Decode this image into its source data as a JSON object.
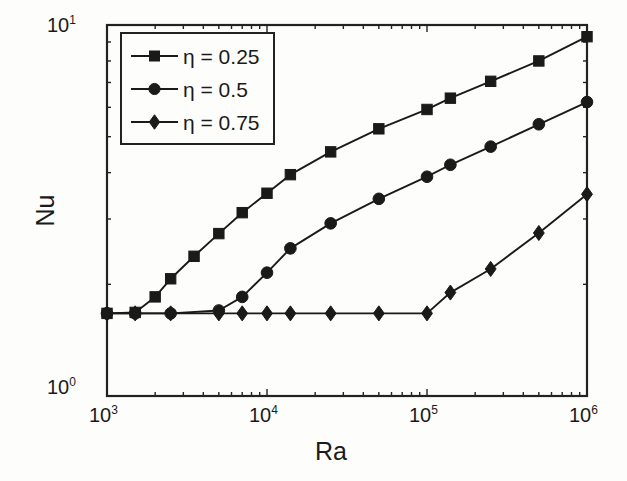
{
  "chart_data": {
    "type": "line",
    "title": "",
    "xlabel": "Ra",
    "ylabel": "Nu",
    "xscale": "log",
    "yscale": "log",
    "xlim": [
      1000,
      1000000
    ],
    "ylim": [
      1,
      10
    ],
    "grid": false,
    "legend_position": "top-left",
    "x_tick_labels": [
      "10",
      "10",
      "10",
      "10"
    ],
    "x_tick_exponents": [
      "3",
      "4",
      "5",
      "6"
    ],
    "x_tick_values": [
      1000,
      10000,
      100000,
      1000000
    ],
    "y_tick_labels": [
      "10",
      "10"
    ],
    "y_tick_exponents": [
      "0",
      "1"
    ],
    "y_tick_values": [
      1,
      10
    ],
    "series": [
      {
        "name": "η = 0.25",
        "marker": "square",
        "color": "#1a1a1a",
        "x": [
          1000,
          1500,
          2000,
          2500,
          3500,
          5000,
          7000,
          10000,
          14000,
          25000,
          50000,
          100000,
          140000,
          250000,
          500000,
          1000000
        ],
        "y": [
          1.67,
          1.68,
          1.85,
          2.07,
          2.38,
          2.74,
          3.12,
          3.52,
          3.95,
          4.55,
          5.25,
          5.92,
          6.35,
          7.05,
          8.0,
          9.3
        ]
      },
      {
        "name": "η = 0.5",
        "marker": "circle",
        "color": "#1a1a1a",
        "x": [
          1000,
          1500,
          2500,
          5000,
          7000,
          10000,
          14000,
          25000,
          50000,
          100000,
          140000,
          250000,
          500000,
          1000000
        ],
        "y": [
          1.67,
          1.67,
          1.67,
          1.7,
          1.85,
          2.15,
          2.5,
          2.92,
          3.4,
          3.9,
          4.2,
          4.7,
          5.4,
          6.2
        ]
      },
      {
        "name": "η = 0.75",
        "marker": "diamond",
        "color": "#1a1a1a",
        "x": [
          1000,
          1500,
          2500,
          5000,
          7000,
          10000,
          14000,
          25000,
          50000,
          100000,
          140000,
          250000,
          500000,
          1000000
        ],
        "y": [
          1.67,
          1.67,
          1.67,
          1.67,
          1.67,
          1.67,
          1.67,
          1.67,
          1.67,
          1.67,
          1.9,
          2.2,
          2.75,
          3.5
        ]
      }
    ]
  },
  "axes": {
    "ylabel": "Nu",
    "xlabel": "Ra"
  },
  "legend": {
    "entries": [
      {
        "label": "η = 0.25",
        "marker": "square"
      },
      {
        "label": "η = 0.5",
        "marker": "circle"
      },
      {
        "label": "η = 0.75",
        "marker": "diamond"
      }
    ]
  },
  "ticks": {
    "x": [
      {
        "mantissa": "10",
        "exponent": "3"
      },
      {
        "mantissa": "10",
        "exponent": "4"
      },
      {
        "mantissa": "10",
        "exponent": "5"
      },
      {
        "mantissa": "10",
        "exponent": "6"
      }
    ],
    "y": [
      {
        "mantissa": "10",
        "exponent": "1"
      },
      {
        "mantissa": "10",
        "exponent": "0"
      }
    ]
  },
  "style": {
    "line_color": "#1a1a1a",
    "axis_color": "#222222",
    "background": "#fdfdfb"
  }
}
